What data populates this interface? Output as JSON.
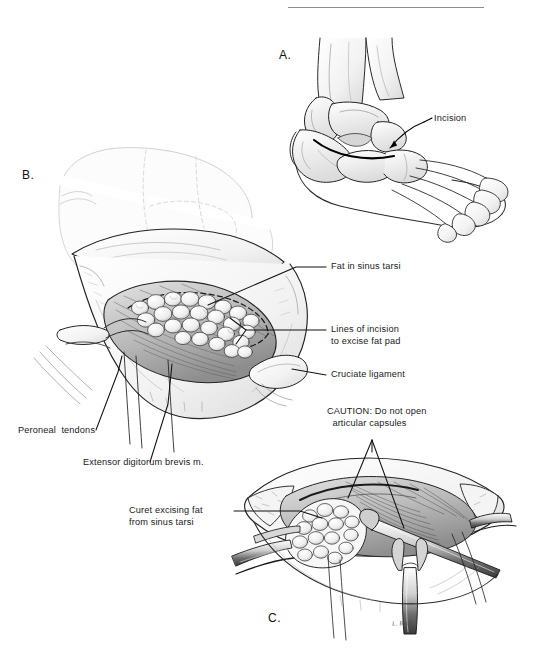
{
  "plate": {
    "title": "Sinus tarsi fat pad excision — operative technique plate",
    "background_color": "#ffffff",
    "ink_color": "#1a1a1a",
    "signature": "L. Beck"
  },
  "top_rule": {
    "present": true
  },
  "panels": [
    {
      "id": "A",
      "letter": "A.",
      "caption": "Dorsolateral view of foot and ankle showing planned skin incision over the sinus tarsi"
    },
    {
      "id": "B",
      "letter": "B.",
      "caption": "Exposure of the sinus tarsi with fat pad, extensor digitorum brevis and cruciate ligament displayed"
    },
    {
      "id": "C",
      "letter": "C.",
      "caption": "Curet used to excise the fat from the sinus tarsi with retractors in place"
    }
  ],
  "labels": [
    {
      "key": "incision",
      "text": "Incision",
      "panel": "A",
      "align": "left"
    },
    {
      "key": "fat_sinus_tarsi",
      "text": "Fat in sinus tarsi",
      "panel": "B",
      "align": "left"
    },
    {
      "key": "lines_incision",
      "text": "Lines of incision\nto excise fat pad",
      "panel": "B",
      "align": "left"
    },
    {
      "key": "cruciate",
      "text": "Cruciate ligament",
      "panel": "B",
      "align": "left"
    },
    {
      "key": "peroneal",
      "text": "Peroneal  tendons",
      "panel": "B",
      "align": "left"
    },
    {
      "key": "edb",
      "text": "Extensor digitorum brevis m.",
      "panel": "B",
      "align": "left"
    },
    {
      "key": "caution",
      "text": "CAUTION: Do not open\n  articular capsules",
      "panel": "C",
      "align": "left"
    },
    {
      "key": "curet",
      "text": "Curet excising fat\nfrom sinus tarsi",
      "panel": "C",
      "align": "left"
    }
  ]
}
